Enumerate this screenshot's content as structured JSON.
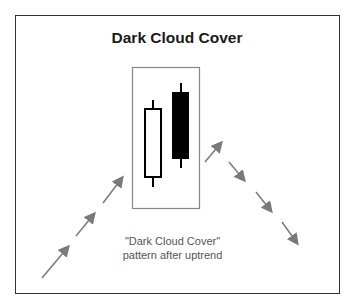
{
  "diagram": {
    "title": "Dark Cloud Cover",
    "caption_line1": "\"Dark Cloud Cover\"",
    "caption_line2": "pattern after uptrend",
    "candles": [
      {
        "type": "bullish",
        "color": "#ffffff"
      },
      {
        "type": "bearish",
        "color": "#000000"
      }
    ],
    "trend_before": "uptrend",
    "trend_after": "downtrend",
    "arrow_color": "#808080"
  }
}
